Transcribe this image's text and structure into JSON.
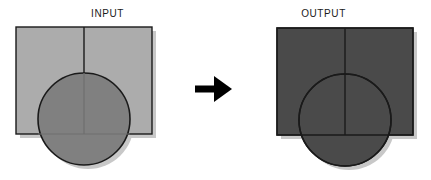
{
  "figure": {
    "type": "diagram",
    "background_color": "#FFFFFF",
    "arrow": {
      "name": "right-arrow",
      "glyph": "→",
      "color": "#000000",
      "direction": "right"
    },
    "palette": {
      "input_rect_fill": "#ACACAC",
      "input_circle_fill": "#808080",
      "output_fill": "#4A4A4A",
      "stroke": "#1A1A1A",
      "shadow": "#C8C8C8",
      "caption_color": "#1A1A1A"
    },
    "panels": [
      {
        "id": "input",
        "caption": "INPUT",
        "merged": false,
        "shapes": [
          {
            "name": "rectangle",
            "kind": "rect",
            "x": 16,
            "y": 27,
            "width": 136,
            "height": 107,
            "fill": "#ACACAC",
            "stroke": "#1A1A1A",
            "stroke_width": 1.4
          },
          {
            "name": "center-line",
            "kind": "line",
            "x1": 84,
            "y1": 27,
            "x2": 84,
            "y2": 134,
            "stroke": "#1A1A1A",
            "stroke_width": 1.4
          },
          {
            "name": "circle",
            "kind": "circle",
            "cx": 84,
            "cy": 119,
            "r": 46,
            "fill": "#808080",
            "stroke": "#1A1A1A",
            "stroke_width": 1.6
          }
        ]
      },
      {
        "id": "output",
        "caption": "OUTPUT",
        "merged": true,
        "shapes": [
          {
            "name": "rectangle",
            "kind": "rect",
            "x": 61,
            "y": 28,
            "width": 136,
            "height": 107,
            "fill": "#4A4A4A",
            "stroke": "#1A1A1A",
            "stroke_width": 1.4
          },
          {
            "name": "center-line",
            "kind": "line",
            "x1": 129,
            "y1": 28,
            "x2": 129,
            "y2": 135,
            "stroke": "#1A1A1A",
            "stroke_width": 1.4
          },
          {
            "name": "circle",
            "kind": "circle",
            "cx": 129,
            "cy": 120,
            "r": 46,
            "fill": "#4A4A4A",
            "stroke": "#1A1A1A",
            "stroke_width": 1.6
          }
        ]
      }
    ]
  }
}
